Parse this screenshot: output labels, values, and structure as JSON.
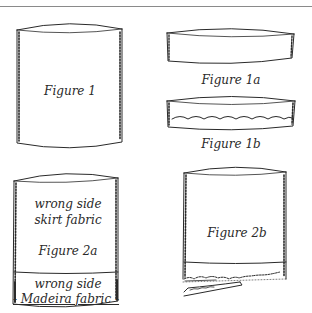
{
  "labels": {
    "fig1": "Figure 1",
    "fig1a": "Figure 1a",
    "fig1b": "Figure 1b",
    "fig2a_line1": "wrong side",
    "fig2a_line2": "skirt fabric",
    "fig2a": "Figure 2a",
    "fig2a_band_line1": "wrong side",
    "fig2a_band_line2": "- Madeira fabric -",
    "fig2b": "Figure 2b"
  },
  "colors": {
    "ink": "#2a2a2a",
    "rule": "#8a8a8a",
    "background": "#ffffff"
  }
}
